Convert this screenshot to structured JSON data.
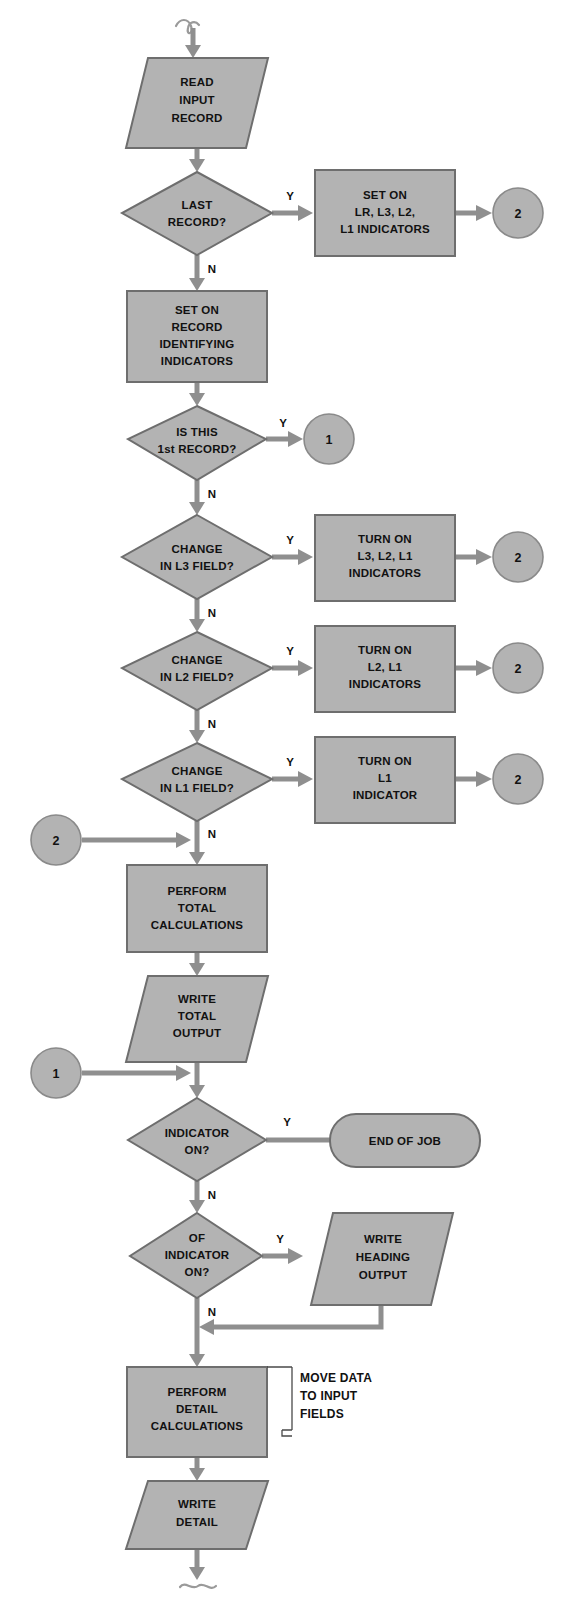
{
  "diagram": {
    "colors": {
      "shape_fill": "#b3b3b3",
      "shape_stroke": "#6e6e6e",
      "flow_line": "#8f8f8f",
      "text": "#111111",
      "background": "#ffffff"
    }
  },
  "nodes": {
    "entry_squiggle": {
      "name": "entry-connector",
      "label": ""
    },
    "read_input": {
      "type": "io",
      "lines": [
        "READ",
        "INPUT",
        "RECORD"
      ]
    },
    "last_record": {
      "type": "decision",
      "lines": [
        "LAST",
        "RECORD?"
      ]
    },
    "set_on_lr": {
      "type": "process",
      "lines": [
        "SET ON",
        "LR, L3, L2,",
        "L1 INDICATORS"
      ]
    },
    "conn_2_a": {
      "type": "connector",
      "label": "2"
    },
    "set_on_record_ident": {
      "type": "process",
      "lines": [
        "SET ON",
        "RECORD",
        "IDENTIFYING",
        "INDICATORS"
      ]
    },
    "is_first_record": {
      "type": "decision",
      "lines": [
        "IS THIS",
        "1st RECORD?"
      ]
    },
    "conn_1_a": {
      "type": "connector",
      "label": "1"
    },
    "change_l3": {
      "type": "decision",
      "lines": [
        "CHANGE",
        "IN L3 FIELD?"
      ]
    },
    "turn_on_l3": {
      "type": "process",
      "lines": [
        "TURN ON",
        "L3, L2, L1",
        "INDICATORS"
      ]
    },
    "conn_2_b": {
      "type": "connector",
      "label": "2"
    },
    "change_l2": {
      "type": "decision",
      "lines": [
        "CHANGE",
        "IN L2 FIELD?"
      ]
    },
    "turn_on_l2": {
      "type": "process",
      "lines": [
        "TURN ON",
        "L2, L1",
        "INDICATORS"
      ]
    },
    "conn_2_c": {
      "type": "connector",
      "label": "2"
    },
    "change_l1": {
      "type": "decision",
      "lines": [
        "CHANGE",
        "IN L1 FIELD?"
      ]
    },
    "turn_on_l1": {
      "type": "process",
      "lines": [
        "TURN ON",
        "L1",
        "INDICATOR"
      ]
    },
    "conn_2_d": {
      "type": "connector",
      "label": "2"
    },
    "conn_2_in": {
      "type": "connector",
      "label": "2"
    },
    "perform_total": {
      "type": "process",
      "lines": [
        "PERFORM",
        "TOTAL",
        "CALCULATIONS"
      ]
    },
    "write_total": {
      "type": "io",
      "lines": [
        "WRITE",
        "TOTAL",
        "OUTPUT"
      ]
    },
    "conn_1_in": {
      "type": "connector",
      "label": "1"
    },
    "indicator_on": {
      "type": "decision",
      "lines": [
        "INDICATOR",
        "ON?"
      ]
    },
    "end_of_job": {
      "type": "terminator",
      "lines": [
        "END OF JOB"
      ]
    },
    "of_indicator_on": {
      "type": "decision",
      "lines": [
        "OF",
        "INDICATOR",
        "ON?"
      ]
    },
    "write_heading": {
      "type": "io",
      "lines": [
        "WRITE",
        "HEADING",
        "OUTPUT"
      ]
    },
    "perform_detail": {
      "type": "process",
      "lines": [
        "PERFORM",
        "DETAIL",
        "CALCULATIONS"
      ]
    },
    "annotation_move_data": {
      "type": "annotation",
      "lines": [
        "MOVE DATA",
        "TO INPUT",
        "FIELDS"
      ]
    },
    "write_detail": {
      "type": "io",
      "lines": [
        "WRITE",
        "DETAIL"
      ]
    },
    "exit_squiggle": {
      "name": "exit-connector",
      "label": ""
    }
  },
  "branch_labels": {
    "last_record_yes": "Y",
    "last_record_no": "N",
    "is_first_record_yes": "Y",
    "is_first_record_no": "N",
    "change_l3_yes": "Y",
    "change_l3_no": "N",
    "change_l2_yes": "Y",
    "change_l2_no": "N",
    "change_l1_yes": "Y",
    "change_l1_no": "N",
    "indicator_on_yes": "Y",
    "indicator_on_no": "N",
    "of_indicator_on_yes": "Y",
    "of_indicator_on_no": "N"
  }
}
